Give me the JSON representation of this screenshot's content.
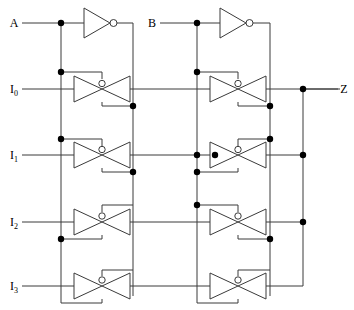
{
  "diagram": {
    "type": "schematic",
    "colors": {
      "wire": "#3a3a3a",
      "node": "#000000",
      "label": "#111111",
      "background": "#ffffff"
    }
  },
  "labels": {
    "select_a": "A",
    "select_b": "B",
    "input_0": "I",
    "input_0_sub": "0",
    "input_1": "I",
    "input_1_sub": "1",
    "input_2": "I",
    "input_2_sub": "2",
    "input_3": "I",
    "input_3_sub": "3",
    "output_z": "Z"
  },
  "ports": {
    "inputs": [
      "A",
      "B",
      "I0",
      "I1",
      "I2",
      "I3"
    ],
    "outputs": [
      "Z"
    ],
    "select_lines": [
      "A",
      "B"
    ]
  },
  "components": {
    "inverters": [
      {
        "name": "inverter-a",
        "input": "A",
        "output": "A-bar"
      },
      {
        "name": "inverter-b",
        "input": "B",
        "output": "B-bar"
      }
    ],
    "transmission_gates": [
      {
        "name": "tgate-a-i0",
        "row": "I0",
        "column": "left",
        "data_in": "I0",
        "control_p": "A",
        "control_n": "A-bar"
      },
      {
        "name": "tgate-a-i1",
        "row": "I1",
        "column": "left",
        "data_in": "I1",
        "control_p": "A",
        "control_n": "A-bar"
      },
      {
        "name": "tgate-a-i2",
        "row": "I2",
        "column": "left",
        "data_in": "I2",
        "control_p": "A-bar",
        "control_n": "A"
      },
      {
        "name": "tgate-a-i3",
        "row": "I3",
        "column": "left",
        "data_in": "I3",
        "control_p": "A-bar",
        "control_n": "A"
      },
      {
        "name": "tgate-b-i0",
        "row": "I0",
        "column": "right",
        "data_in": "stage1-0",
        "control_p": "B",
        "control_n": "B-bar"
      },
      {
        "name": "tgate-b-i1",
        "row": "I1",
        "column": "right",
        "data_in": "stage1-1",
        "control_p": "B-bar",
        "control_n": "B"
      },
      {
        "name": "tgate-b-i2",
        "row": "I2",
        "column": "right",
        "data_in": "stage1-2",
        "control_p": "B",
        "control_n": "B-bar"
      },
      {
        "name": "tgate-b-i3",
        "row": "I3",
        "column": "right",
        "data_in": "stage1-3",
        "control_p": "B-bar",
        "control_n": "B"
      }
    ],
    "junction_count": 20
  },
  "rows": {
    "y_a": 23,
    "y_i0": 89,
    "y_i1": 155,
    "y_i2": 222,
    "y_i3": 286
  }
}
